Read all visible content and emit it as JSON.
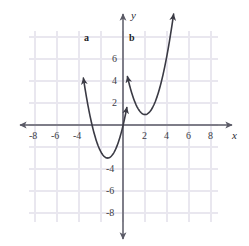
{
  "figure": {
    "width": 249,
    "height": 246,
    "background": "#ffffff"
  },
  "chart_data": {
    "type": "line",
    "title": "",
    "xlabel": "x",
    "ylabel": "y",
    "xlim": [
      -9,
      9
    ],
    "ylim": [
      -9,
      9
    ],
    "grid": true,
    "grid_spacing": 2,
    "grid_color": "#e9e7ef",
    "axis_color": "#5a5a66",
    "curve_color": "#3a3a44",
    "legend": "none",
    "x_ticks": [
      -8,
      -6,
      -4,
      2,
      4,
      6,
      8
    ],
    "x_tick_labels": [
      "-8",
      "-6",
      "-4",
      "2",
      "4",
      "6",
      "8"
    ],
    "y_ticks": [
      6,
      4,
      2,
      -4,
      -6,
      -8
    ],
    "y_tick_labels": [
      "6",
      "4",
      "2",
      "-4",
      "-6",
      "-8"
    ],
    "origin_px": {
      "x": 123,
      "y": 125
    },
    "unit_px": 11,
    "series": [
      {
        "name": "a",
        "label": "a",
        "type": "parabola",
        "vertex": [
          -1.4,
          -3.0
        ],
        "a": 1.5,
        "x_start": -3.6,
        "x_end": 0.35,
        "arrows": [
          "start",
          "end"
        ],
        "label_point": [
          -3.75,
          7.9
        ]
      },
      {
        "name": "b",
        "label": "b",
        "type": "parabola",
        "vertex": [
          2.0,
          0.95
        ],
        "a": 1.35,
        "x_start": 0.4,
        "x_end": 4.6,
        "arrows": [
          "start",
          "end"
        ],
        "label_point": [
          0.45,
          7.9
        ]
      }
    ],
    "annotations": [
      {
        "text": "a",
        "x": -3.75,
        "y": 7.9
      },
      {
        "text": "b",
        "x": 0.45,
        "y": 7.9
      },
      {
        "text": "x",
        "x": 8.9,
        "y": -0.85
      },
      {
        "text": "y",
        "x": 0.85,
        "y": 8.6
      }
    ]
  },
  "axis_labels": {
    "x_axis_name": "x",
    "y_axis_name": "y"
  },
  "curve_labels": {
    "a": "a",
    "b": "b"
  },
  "tick_labels": {
    "x": {
      "n8": "-8",
      "n6": "-6",
      "n4": "-4",
      "p2": "2",
      "p4": "4",
      "p6": "6",
      "p8": "8"
    },
    "y": {
      "p6": "6",
      "p4": "4",
      "p2": "2",
      "n4": "-4",
      "n6": "-6",
      "n8": "-8"
    }
  }
}
